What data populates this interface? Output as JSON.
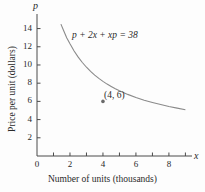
{
  "chart_data": {
    "type": "line",
    "title": "",
    "equation_label": "p + 2x + xp = 38",
    "xlabel": "Number of units (thousands)",
    "ylabel": "Price per unit (dollars)",
    "x_axis_symbol": "x",
    "y_axis_symbol": "p",
    "xlim": [
      0,
      9.4
    ],
    "ylim": [
      0,
      15.6
    ],
    "grid": false,
    "legend": null,
    "x_ticks_major": [
      0,
      2,
      4,
      6,
      8
    ],
    "x_ticks_minor": [
      1,
      3,
      5,
      7,
      9
    ],
    "x_tick_labels": [
      "0",
      "2",
      "4",
      "6",
      "8"
    ],
    "y_ticks_major": [
      2,
      4,
      6,
      8,
      10,
      12,
      14
    ],
    "y_tick_labels": [
      "2",
      "4",
      "6",
      "8",
      "10",
      "12",
      "14"
    ],
    "curve_color": "#8a8a8a",
    "axis_color": "#4a4a4a",
    "text_color": "#2a2a2a",
    "annotations": [
      {
        "label": "(4, 6)",
        "x": 4,
        "y": 6,
        "marker": true
      }
    ],
    "series": [
      {
        "name": "p = (38 - 2x) / (1 + x)",
        "x": [
          1.45,
          1.6,
          1.8,
          2.0,
          2.25,
          2.5,
          2.75,
          3.0,
          3.25,
          3.5,
          3.75,
          4.0,
          4.25,
          4.5,
          4.75,
          5.0,
          5.5,
          6.0,
          6.5,
          7.0,
          7.5,
          8.0,
          8.5,
          9.0
        ],
        "y": [
          14.49,
          13.85,
          13.0,
          12.33,
          11.54,
          10.86,
          10.27,
          9.75,
          9.29,
          8.89,
          8.53,
          8.2,
          7.9,
          7.64,
          7.39,
          7.17,
          6.77,
          6.43,
          6.13,
          5.88,
          5.65,
          5.44,
          5.26,
          5.09
        ]
      }
    ]
  },
  "axis_titles": {
    "x": "Number of units (thousands)",
    "y": "Price per unit (dollars)"
  }
}
